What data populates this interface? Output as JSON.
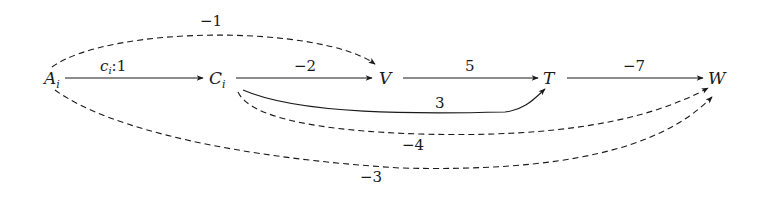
{
  "diagram": {
    "type": "directed-weighted-graph",
    "nodes": [
      {
        "id": "A",
        "label": "A",
        "subscript": "i"
      },
      {
        "id": "C",
        "label": "C",
        "subscript": "i"
      },
      {
        "id": "V",
        "label": "V",
        "subscript": ""
      },
      {
        "id": "T",
        "label": "T",
        "subscript": ""
      },
      {
        "id": "W",
        "label": "W",
        "subscript": ""
      }
    ],
    "edges": [
      {
        "from": "A",
        "to": "C",
        "label": "c",
        "label_sub": "i",
        "label_rest": ":1",
        "style": "solid",
        "route": "straight"
      },
      {
        "from": "C",
        "to": "V",
        "label": "−2",
        "style": "solid",
        "route": "straight"
      },
      {
        "from": "V",
        "to": "T",
        "label": "5",
        "style": "solid",
        "route": "straight"
      },
      {
        "from": "T",
        "to": "W",
        "label": "−7",
        "style": "solid",
        "route": "straight"
      },
      {
        "from": "A",
        "to": "V",
        "label": "−1",
        "style": "dashed",
        "route": "arc-above"
      },
      {
        "from": "C",
        "to": "T",
        "label": "3",
        "style": "solid",
        "route": "curve-below"
      },
      {
        "from": "C",
        "to": "W",
        "label": "−4",
        "style": "dashed",
        "route": "curve-below"
      },
      {
        "from": "A",
        "to": "W",
        "label": "−3",
        "style": "dashed",
        "route": "curve-below-wide"
      }
    ]
  }
}
